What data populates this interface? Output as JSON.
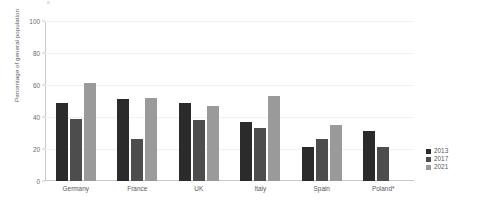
{
  "chart_data": {
    "type": "bar",
    "title": "",
    "xlabel": "",
    "ylabel": "Percentage of general population",
    "ylim": [
      0,
      100
    ],
    "yticks": [
      0,
      20,
      40,
      60,
      80,
      100
    ],
    "grid": true,
    "legend_position": "right",
    "categories": [
      "Germany",
      "France",
      "UK",
      "Italy",
      "Spain",
      "Poland*"
    ],
    "series": [
      {
        "name": "2013",
        "color": "#2b2b2b",
        "values": [
          49,
          51,
          49,
          37,
          21,
          31
        ]
      },
      {
        "name": "2017",
        "color": "#4d4d4d",
        "values": [
          39,
          26,
          38,
          33,
          26,
          21
        ]
      },
      {
        "name": "2021",
        "color": "#9a9a9a",
        "values": [
          61,
          52,
          47,
          53,
          35,
          null
        ]
      }
    ]
  },
  "axis": {
    "y_title": "Percentage of general population",
    "tick_labels": [
      "0",
      "20",
      "40",
      "60",
      "80",
      "100"
    ]
  },
  "legend": {
    "items": [
      {
        "label": "2013"
      },
      {
        "label": "2017"
      },
      {
        "label": "2021"
      }
    ]
  },
  "categories": [
    {
      "label": "Germany"
    },
    {
      "label": "France"
    },
    {
      "label": "UK"
    },
    {
      "label": "Italy"
    },
    {
      "label": "Spain"
    },
    {
      "label": "Poland*"
    }
  ]
}
